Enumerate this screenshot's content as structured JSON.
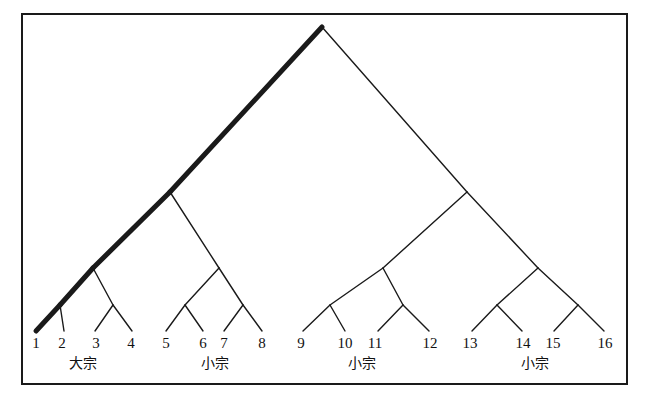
{
  "figure": {
    "name": "lineage-descent-tree-diagram",
    "type": "binary-descent-tree",
    "frame": {
      "x": 22,
      "y": 14,
      "width": 605,
      "height": 370,
      "stroke": "#1a1a1a",
      "stroke_width": 2
    },
    "colors": {
      "ink": "#111111",
      "line": "#1a1a1a",
      "background": "#ffffff",
      "emphasis": "#000000"
    },
    "apex": {
      "x": 322,
      "y": 27
    },
    "emphasis_path_label": "bold main-descent line from apex to leaf 1",
    "leaves": [
      {
        "id": 1,
        "label": "1",
        "x": 36,
        "y": 330,
        "emphasized": true
      },
      {
        "id": 2,
        "label": "2",
        "x": 62,
        "y": 330,
        "emphasized": false
      },
      {
        "id": 3,
        "label": "3",
        "x": 96,
        "y": 330,
        "emphasized": false
      },
      {
        "id": 4,
        "label": "4",
        "x": 131,
        "y": 330,
        "emphasized": false
      },
      {
        "id": 5,
        "label": "5",
        "x": 166,
        "y": 330,
        "emphasized": false
      },
      {
        "id": 6,
        "label": "6",
        "x": 203,
        "y": 330,
        "emphasized": false
      },
      {
        "id": 7,
        "label": "7",
        "x": 224,
        "y": 330,
        "emphasized": false
      },
      {
        "id": 8,
        "label": "8",
        "x": 262,
        "y": 330,
        "emphasized": false
      },
      {
        "id": 9,
        "label": "9",
        "x": 301,
        "y": 330,
        "emphasized": false
      },
      {
        "id": 10,
        "label": "10",
        "x": 345,
        "y": 330,
        "emphasized": false
      },
      {
        "id": 11,
        "label": "11",
        "x": 375,
        "y": 330,
        "emphasized": false
      },
      {
        "id": 12,
        "label": "12",
        "x": 430,
        "y": 330,
        "emphasized": false
      },
      {
        "id": 13,
        "label": "13",
        "x": 470,
        "y": 330,
        "emphasized": false
      },
      {
        "id": 14,
        "label": "14",
        "x": 523,
        "y": 330,
        "emphasized": false
      },
      {
        "id": 15,
        "label": "15",
        "x": 553,
        "y": 330,
        "emphasized": false
      },
      {
        "id": 16,
        "label": "16",
        "x": 605,
        "y": 330,
        "emphasized": false
      }
    ],
    "group_labels": [
      {
        "text": "大宗",
        "x": 83,
        "y": 363,
        "leaves": "1-4",
        "meaning": "main lineage"
      },
      {
        "text": "小宗",
        "x": 215,
        "y": 363,
        "leaves": "5-8",
        "meaning": "lesser lineage"
      },
      {
        "text": "小宗",
        "x": 362,
        "y": 363,
        "leaves": "9-12",
        "meaning": "lesser lineage"
      },
      {
        "text": "小宗",
        "x": 535,
        "y": 363,
        "leaves": "13-16",
        "meaning": "lesser lineage"
      }
    ],
    "nodes": [
      {
        "id": "root",
        "x": 322,
        "y": 27
      },
      {
        "id": "L",
        "x": 170,
        "y": 192
      },
      {
        "id": "R",
        "x": 467,
        "y": 192
      },
      {
        "id": "LL",
        "x": 93,
        "y": 268
      },
      {
        "id": "LR",
        "x": 219,
        "y": 268
      },
      {
        "id": "RL",
        "x": 383,
        "y": 268
      },
      {
        "id": "RR",
        "x": 538,
        "y": 268
      },
      {
        "id": "LLL",
        "x": 60,
        "y": 305
      },
      {
        "id": "LLR",
        "x": 113,
        "y": 305
      },
      {
        "id": "LRL",
        "x": 185,
        "y": 305
      },
      {
        "id": "LRR",
        "x": 243,
        "y": 305
      },
      {
        "id": "RLL",
        "x": 330,
        "y": 305
      },
      {
        "id": "RLR",
        "x": 403,
        "y": 305
      },
      {
        "id": "RRL",
        "x": 497,
        "y": 305
      },
      {
        "id": "RRR",
        "x": 578,
        "y": 305
      }
    ],
    "branches": [
      {
        "from": "root",
        "to": "L",
        "bold": true
      },
      {
        "from": "root",
        "to": "R",
        "bold": false
      },
      {
        "from": "L",
        "to": "LL",
        "bold": true
      },
      {
        "from": "L",
        "to": "LR",
        "bold": false
      },
      {
        "from": "R",
        "to": "RL",
        "bold": false
      },
      {
        "from": "R",
        "to": "RR",
        "bold": false
      },
      {
        "from": "LL",
        "to": "LLL",
        "bold": true
      },
      {
        "from": "LL",
        "to": "LLR",
        "bold": false
      },
      {
        "from": "LR",
        "to": "LRL",
        "bold": false
      },
      {
        "from": "LR",
        "to": "LRR",
        "bold": false
      },
      {
        "from": "RL",
        "to": "RLL",
        "bold": false
      },
      {
        "from": "RL",
        "to": "RLR",
        "bold": false
      },
      {
        "from": "RR",
        "to": "RRL",
        "bold": false
      },
      {
        "from": "RR",
        "to": "RRR",
        "bold": false
      }
    ]
  }
}
